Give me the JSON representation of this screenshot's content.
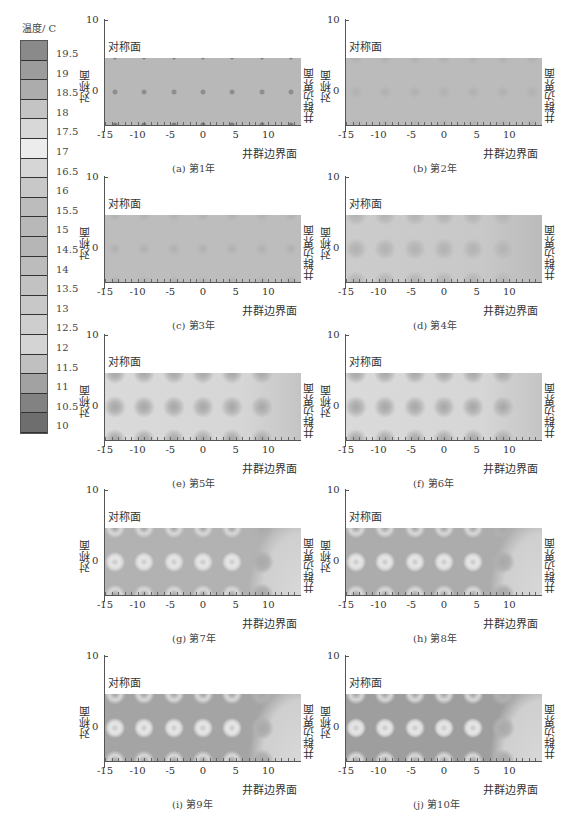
{
  "colorbar": {
    "title": "温度/ C",
    "labels": [
      "19.5",
      "19",
      "18.5",
      "18",
      "17.5",
      "17",
      "16.5",
      "16",
      "15.5",
      "15",
      "14.5",
      "14",
      "13.5",
      "13",
      "12.5",
      "12",
      "11.5",
      "11",
      "10.5",
      "10"
    ],
    "colors": [
      "#8a8a8a",
      "#9c9c9c",
      "#acacac",
      "#c4c4c4",
      "#d8d8d8",
      "#ececec",
      "#d6d6d6",
      "#c8c8c8",
      "#bcbcbc",
      "#b8b8b8",
      "#b6b6b6",
      "#bcbcbc",
      "#c2c2c2",
      "#c8c8c8",
      "#cecece",
      "#d4d4d4",
      "#c0c0c0",
      "#a2a2a2",
      "#828282",
      "#6e6e6e"
    ]
  },
  "common": {
    "symmetry_label": "对称面",
    "boundary_label": "井群边界面",
    "y_ticks": [
      "10",
      "0"
    ],
    "x_ticks": [
      "-15",
      "-10",
      "-5",
      "0",
      "5",
      "10"
    ]
  },
  "panels": [
    {
      "id": "a",
      "caption": "(a) 第1年",
      "bg": "#b8b8b8",
      "pattern": "uniform-dots"
    },
    {
      "id": "b",
      "caption": "(b) 第2年",
      "bg": "#bbbbbb",
      "pattern": "faint"
    },
    {
      "id": "c",
      "caption": "(c) 第3年",
      "bg": "#bdbdbd",
      "pattern": "faint"
    },
    {
      "id": "d",
      "caption": "(d) 第4年",
      "bg": "#c6c6c6",
      "pattern": "soft-wells"
    },
    {
      "id": "e",
      "caption": "(e) 第5年",
      "bg": "#d4d4d4",
      "pattern": "wells"
    },
    {
      "id": "f",
      "caption": "(f) 第6年",
      "bg": "#d2d2d2",
      "pattern": "wells"
    },
    {
      "id": "g",
      "caption": "(g) 第7年",
      "bg": "#b2b2b2",
      "pattern": "rings"
    },
    {
      "id": "h",
      "caption": "(h) 第8年",
      "bg": "#acacac",
      "pattern": "rings"
    },
    {
      "id": "i",
      "caption": "(i) 第9年",
      "bg": "#a4a4a4",
      "pattern": "rings"
    },
    {
      "id": "j",
      "caption": "(j) 第10年",
      "bg": "#9e9e9e",
      "pattern": "rings"
    }
  ],
  "chart_data": {
    "type": "heatmap",
    "colorbar_label": "温度/ C",
    "colorbar_range": [
      10,
      19.5
    ],
    "colorbar_step": 0.5,
    "xlabel": "井群边界面",
    "ylabel": "对称面",
    "x_ticks": [
      -15,
      -10,
      -5,
      0,
      5,
      10
    ],
    "y_ticks": [
      0,
      10
    ],
    "xlim": [
      -15,
      15
    ],
    "ylim": [
      -5,
      10
    ],
    "plot_region_y": [
      -5,
      5
    ],
    "well_positions_x": [
      -13.5,
      -9,
      -4.5,
      0,
      4.5,
      9,
      13.5
    ],
    "well_rows_y": [
      5,
      0,
      -5
    ],
    "panels": [
      {
        "label": "(a) 第1年",
        "year": 1,
        "description": "nearly uniform ~15 C field, small dark well points"
      },
      {
        "label": "(b) 第2年",
        "year": 2,
        "description": "nearly uniform, faint well disturbances"
      },
      {
        "label": "(c) 第3年",
        "year": 3,
        "description": "nearly uniform, faint well disturbances"
      },
      {
        "label": "(d) 第4年",
        "year": 4,
        "description": "soft darker halos around wells on left side"
      },
      {
        "label": "(e) 第5年",
        "year": 5,
        "description": "lighter background with distinct well halos, right side uniform"
      },
      {
        "label": "(f) 第6年",
        "year": 6,
        "description": "lighter background with distinct well halos"
      },
      {
        "label": "(g) 第7年",
        "year": 7,
        "description": "darker (cooler) region left, bright rings around wells, lighter right boundary"
      },
      {
        "label": "(h) 第8年",
        "year": 8,
        "description": "cooling region expands, bright rings around wells"
      },
      {
        "label": "(i) 第9年",
        "year": 9,
        "description": "dark cool zone dominant left, bright rings, light band near right boundary"
      },
      {
        "label": "(j) 第10年",
        "year": 10,
        "description": "strongest cooling, dark zone left, bright rings, light curved band at right"
      }
    ]
  }
}
